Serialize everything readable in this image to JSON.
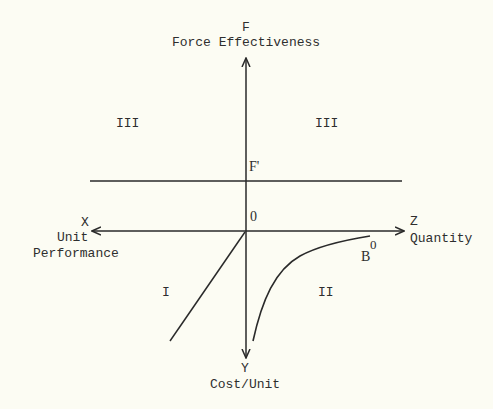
{
  "axes": {
    "top": {
      "letter": "F",
      "label": "Force Effectiveness"
    },
    "left": {
      "letter": "X",
      "label_line1": "Unit",
      "label_line2": "Performance"
    },
    "right": {
      "letter": "Z",
      "label": "Quantity"
    },
    "bottom": {
      "letter": "Y",
      "label": "Cost/Unit"
    },
    "origin": "0"
  },
  "markers": {
    "f_prime": "F'",
    "curve_end": "B",
    "curve_end_sup": "0"
  },
  "quadrants": {
    "upper_left": "III",
    "upper_right": "III",
    "lower_left": "I",
    "lower_right": "II"
  },
  "colors": {
    "background": "#fcfcf3",
    "ink": "#2a2a2a"
  }
}
